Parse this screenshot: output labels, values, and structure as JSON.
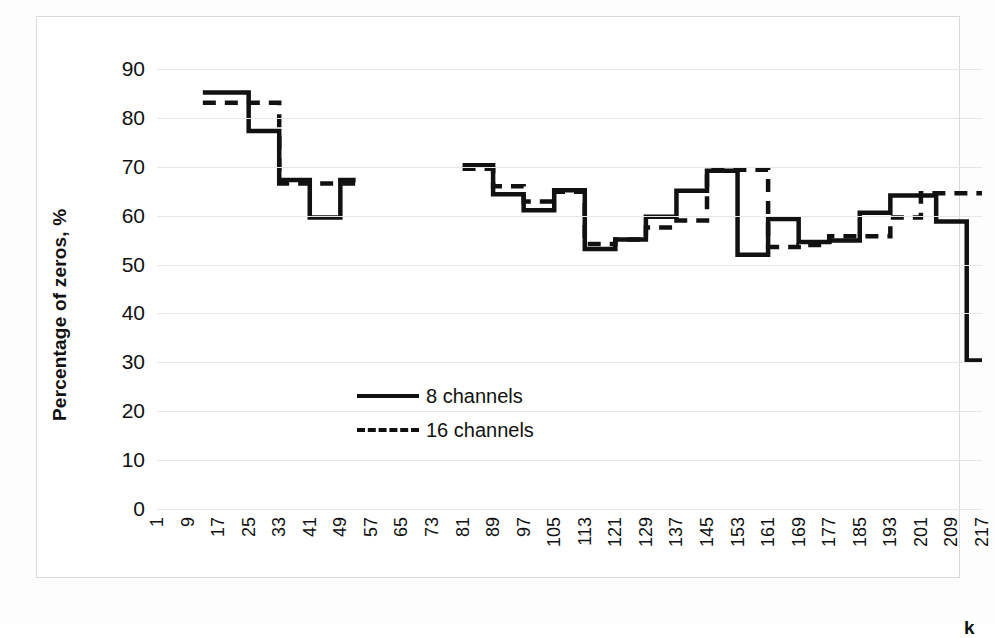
{
  "chart_data": {
    "type": "line",
    "title": "",
    "xlabel": "k",
    "ylabel": "Percentage of zeros, %",
    "ylim": [
      0,
      90
    ],
    "ytick_values": [
      0,
      10,
      20,
      30,
      40,
      50,
      60,
      70,
      80,
      90
    ],
    "xlim": [
      1,
      217
    ],
    "xtick_values": [
      1,
      9,
      17,
      25,
      33,
      41,
      49,
      57,
      65,
      73,
      81,
      89,
      97,
      105,
      113,
      121,
      129,
      137,
      145,
      153,
      161,
      169,
      177,
      185,
      193,
      201,
      209,
      217
    ],
    "grid": "horizontal",
    "legend_position": "center",
    "line_color": "#111111",
    "series": [
      {
        "name": "8 channels",
        "style": "solid",
        "segments": [
          {
            "x": [
              13,
              21,
              25,
              29,
              33,
              37,
              41,
              45,
              49,
              53
            ],
            "y": [
              85.2,
              85.2,
              77.3,
              77.3,
              67.3,
              67.3,
              59.6,
              59.6,
              67.3,
              67.3
            ]
          },
          {
            "x": [
              81,
              85,
              89,
              93,
              97,
              101,
              105,
              109,
              113,
              117,
              121,
              125,
              129,
              133,
              137,
              141,
              145,
              149,
              153,
              157,
              161,
              165,
              169,
              173,
              177,
              181,
              185,
              189,
              193,
              197,
              201,
              205,
              209,
              213,
              217
            ],
            "y": [
              70.3,
              70.3,
              64.4,
              64.4,
              61.1,
              61.1,
              65.2,
              65.2,
              53.2,
              53.2,
              55.1,
              55.1,
              59.8,
              59.8,
              65.1,
              65.1,
              69.2,
              69.2,
              52.0,
              52.0,
              59.3,
              59.3,
              54.6,
              54.6,
              54.9,
              54.9,
              60.6,
              60.6,
              64.1,
              64.1,
              64.1,
              58.8,
              58.8,
              30.4,
              30.4
            ]
          }
        ]
      },
      {
        "name": "16 channels",
        "style": "dashed",
        "segments": [
          {
            "x": [
              13,
              21,
              25,
              29,
              33,
              37,
              41,
              45,
              49,
              53
            ],
            "y": [
              83.1,
              83.1,
              83.1,
              83.1,
              66.6,
              66.6,
              66.6,
              66.6,
              66.6,
              66.6
            ]
          },
          {
            "x": [
              81,
              85,
              89,
              93,
              97,
              101,
              105,
              109,
              113,
              117,
              121,
              125,
              129,
              133,
              137,
              141,
              145,
              149,
              153,
              157,
              161,
              165,
              169,
              173,
              177,
              181,
              185,
              189,
              193,
              197,
              201,
              205,
              209,
              213,
              217
            ],
            "y": [
              69.6,
              69.6,
              66.0,
              66.0,
              62.9,
              62.9,
              64.9,
              64.9,
              54.2,
              54.2,
              55.1,
              55.1,
              57.6,
              57.6,
              59.0,
              59.0,
              69.4,
              69.4,
              69.4,
              69.4,
              53.6,
              53.6,
              54.0,
              54.0,
              55.8,
              55.8,
              55.8,
              55.8,
              59.6,
              59.6,
              64.6,
              64.6,
              64.6,
              64.6,
              64.6
            ]
          }
        ]
      }
    ]
  },
  "legend": {
    "items": [
      {
        "label": "8 channels",
        "style": "solid"
      },
      {
        "label": "16 channels",
        "style": "dashed"
      }
    ]
  }
}
